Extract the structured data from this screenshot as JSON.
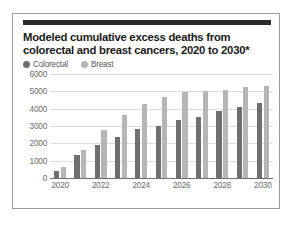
{
  "card": {
    "title_line1": "Modeled cumulative excess deaths from",
    "title_line2": "colorectal and breast cancers, 2020 to 2030*"
  },
  "colors": {
    "colorectal": "#6f6f6f",
    "breast": "#b6b6b6",
    "gridline": "#dcdcdc",
    "axis": "#6e6e6e",
    "title": "#1b1b1b",
    "tick_text": "#6b6b6b",
    "rule": "#2b2b2b",
    "border": "#9a9a9a"
  },
  "chart_data": {
    "type": "bar",
    "title": "Modeled cumulative excess deaths from colorectal and breast cancers, 2020 to 2030*",
    "xlabel": "",
    "ylabel": "",
    "ylim": [
      0,
      6000
    ],
    "yticks": [
      6000,
      5000,
      4000,
      3000,
      2000,
      1000,
      0
    ],
    "grid": true,
    "legend_position": "top-left",
    "categories": [
      "2020",
      "2021",
      "2022",
      "2023",
      "2024",
      "2025",
      "2026",
      "2027",
      "2028",
      "2029",
      "2030"
    ],
    "tick_labels": [
      "2020",
      "",
      "2022",
      "",
      "2024",
      "",
      "2026",
      "",
      "2028",
      "",
      "2030"
    ],
    "series": [
      {
        "name": "Colorectal",
        "color": "#6f6f6f",
        "values": [
          400,
          1300,
          1900,
          2350,
          2850,
          2980,
          3320,
          3520,
          3880,
          4120,
          4350
        ]
      },
      {
        "name": "Breast",
        "color": "#b6b6b6",
        "values": [
          650,
          1620,
          2770,
          3630,
          4270,
          4670,
          4940,
          5040,
          5070,
          5240,
          5300
        ]
      }
    ]
  }
}
